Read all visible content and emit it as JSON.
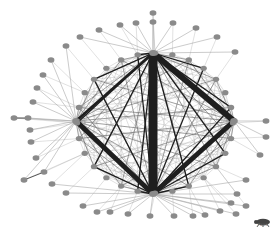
{
  "diagram": {
    "type": "network-graph",
    "colors": {
      "background": "#ffffff",
      "node_fill": "#8a8a8a",
      "node_stroke": "#7a7a7a",
      "thin_edge": "#a8a8a8",
      "core_edge": "#6a6a6a",
      "hub_edge": "#1e1e1e"
    },
    "hubs": [
      {
        "id": "top",
        "x": 153,
        "y": 53
      },
      {
        "id": "left",
        "x": 76,
        "y": 121
      },
      {
        "id": "right",
        "x": 234,
        "y": 121
      },
      {
        "id": "bottom",
        "x": 153,
        "y": 194
      }
    ],
    "hub_edges": [
      {
        "from": "top",
        "to": "bottom",
        "width": 9
      },
      {
        "from": "top",
        "to": "right",
        "width": 6
      },
      {
        "from": "right",
        "to": "bottom",
        "width": 5
      },
      {
        "from": "left",
        "to": "bottom",
        "width": 5
      },
      {
        "from": "left",
        "to": "top",
        "width": 2.5
      }
    ],
    "core_ring": {
      "cx": 155,
      "cy": 123,
      "rx": 78,
      "ry": 70,
      "count": 28
    },
    "peripheral_nodes": [
      {
        "x": 153,
        "y": 13,
        "hub": "top"
      },
      {
        "x": 153,
        "y": 22,
        "hub": "top"
      },
      {
        "x": 136,
        "y": 23,
        "hub": "top"
      },
      {
        "x": 120,
        "y": 25,
        "hub": "top"
      },
      {
        "x": 173,
        "y": 23,
        "hub": "top"
      },
      {
        "x": 196,
        "y": 28,
        "hub": "top"
      },
      {
        "x": 217,
        "y": 37,
        "hub": "top"
      },
      {
        "x": 235,
        "y": 52,
        "hub": "top"
      },
      {
        "x": 99,
        "y": 30,
        "hub": "top"
      },
      {
        "x": 80,
        "y": 37,
        "hub": "top"
      },
      {
        "x": 66,
        "y": 46,
        "hub": "left"
      },
      {
        "x": 51,
        "y": 60,
        "hub": "left"
      },
      {
        "x": 43,
        "y": 75,
        "hub": "left"
      },
      {
        "x": 37,
        "y": 88,
        "hub": "left"
      },
      {
        "x": 33,
        "y": 102,
        "hub": "left"
      },
      {
        "x": 14,
        "y": 118,
        "hub": "left"
      },
      {
        "x": 28,
        "y": 118,
        "hub": "left"
      },
      {
        "x": 30,
        "y": 130,
        "hub": "left"
      },
      {
        "x": 31,
        "y": 142,
        "hub": "left"
      },
      {
        "x": 36,
        "y": 158,
        "hub": "left"
      },
      {
        "x": 44,
        "y": 172,
        "hub": "left"
      },
      {
        "x": 24,
        "y": 180,
        "hub": "left"
      },
      {
        "x": 52,
        "y": 184,
        "hub": "bottom"
      },
      {
        "x": 66,
        "y": 193,
        "hub": "bottom"
      },
      {
        "x": 83,
        "y": 206,
        "hub": "bottom"
      },
      {
        "x": 97,
        "y": 212,
        "hub": "bottom"
      },
      {
        "x": 110,
        "y": 212,
        "hub": "bottom"
      },
      {
        "x": 128,
        "y": 214,
        "hub": "bottom"
      },
      {
        "x": 150,
        "y": 216,
        "hub": "bottom"
      },
      {
        "x": 174,
        "y": 216,
        "hub": "bottom"
      },
      {
        "x": 193,
        "y": 216,
        "hub": "bottom"
      },
      {
        "x": 205,
        "y": 215,
        "hub": "bottom"
      },
      {
        "x": 220,
        "y": 211,
        "hub": "bottom"
      },
      {
        "x": 236,
        "y": 214,
        "hub": "bottom"
      },
      {
        "x": 231,
        "y": 203,
        "hub": "bottom"
      },
      {
        "x": 246,
        "y": 206,
        "hub": "bottom"
      },
      {
        "x": 237,
        "y": 194,
        "hub": "bottom"
      },
      {
        "x": 246,
        "y": 180,
        "hub": "bottom"
      },
      {
        "x": 260,
        "y": 155,
        "hub": "right"
      },
      {
        "x": 266,
        "y": 137,
        "hub": "right"
      },
      {
        "x": 266,
        "y": 121,
        "hub": "right"
      }
    ],
    "peripheral_pairs": [
      {
        "a": 15,
        "b": 16
      },
      {
        "a": 20,
        "b": 21
      }
    ]
  },
  "logo": {
    "name": "Pajek",
    "icon": "beetle-icon"
  }
}
